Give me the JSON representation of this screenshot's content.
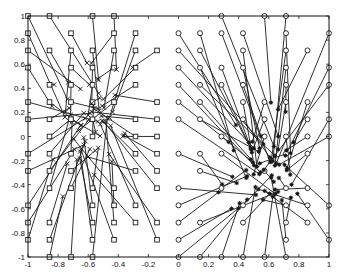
{
  "chart_data": {
    "type": "scatter",
    "title": "",
    "xlabel": "",
    "ylabel": "",
    "xlim": [
      -1,
      1
    ],
    "ylim": [
      -1,
      1
    ],
    "grid": false,
    "legend": null,
    "x_ticks": [
      "-1",
      "-0.8",
      "-0.6",
      "-0.4",
      "-0.2",
      "0",
      "0.2",
      "0.4",
      "0.6",
      "0.8",
      "1"
    ],
    "y_ticks": [
      "-1",
      "-0.8",
      "-0.6",
      "-0.4",
      "-0.2",
      "0",
      "0.2",
      "0.4",
      "0.6",
      "0.8",
      "1"
    ],
    "x_tick_values": [
      -1,
      -0.8,
      -0.6,
      -0.4,
      -0.2,
      0,
      0.2,
      0.4,
      0.6,
      0.8,
      1
    ],
    "y_tick_values": [
      -1,
      -0.8,
      -0.6,
      -0.4,
      -0.2,
      0,
      0.2,
      0.4,
      0.6,
      0.8,
      1
    ],
    "series": [
      {
        "name": "left-class initial positions",
        "marker": "square",
        "region": "x < 0",
        "grid_step": 0.142857,
        "cluster_center": [
          -0.6,
          0.15
        ]
      },
      {
        "name": "left-class mapped positions",
        "marker": "x",
        "cluster_center": [
          -0.6,
          0.15
        ]
      },
      {
        "name": "right-class initial positions",
        "marker": "circle",
        "region": "x >= 0",
        "grid_step": 0.142857,
        "cluster_center": [
          0.6,
          -0.35
        ]
      },
      {
        "name": "right-class mapped positions",
        "marker": "asterisk",
        "cluster_center": [
          0.6,
          -0.35
        ]
      }
    ],
    "annotations": "Line segments connect each grid node (square/circle) to its mapped point (x/asterisk)"
  },
  "colors": {
    "line": "#1a1a1a",
    "background": "#ffffff"
  }
}
